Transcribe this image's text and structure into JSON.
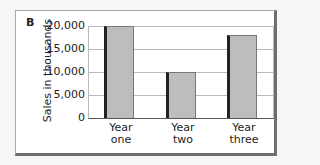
{
  "panel_label": "B",
  "chart_data": {
    "type": "bar",
    "title": "",
    "xlabel": "",
    "ylabel": "Sales in thousands",
    "categories": [
      "Year one",
      "Year two",
      "Year three"
    ],
    "values": [
      20000,
      10000,
      18000
    ],
    "ylim": [
      0,
      20000
    ],
    "yticks": [
      "20,000",
      "15,000",
      "10,000",
      "5,000",
      "0"
    ],
    "grid": true,
    "legend": null
  },
  "x_labels": [
    {
      "line1": "Year",
      "line2": "one"
    },
    {
      "line1": "Year",
      "line2": "two"
    },
    {
      "line1": "Year",
      "line2": "three"
    }
  ]
}
